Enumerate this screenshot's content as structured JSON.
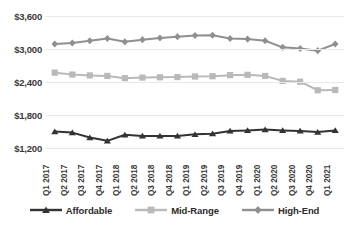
{
  "chart_data": {
    "type": "line",
    "title": "",
    "subtitle": "",
    "xlabel": "",
    "ylabel": "",
    "ylim": [
      1200,
      3600
    ],
    "yticks": [
      1200,
      1800,
      2400,
      3000,
      3600
    ],
    "ytick_labels": [
      "$1,200",
      "$1,800",
      "$2,400",
      "$3,000",
      "$3,600"
    ],
    "grid": true,
    "legend_position": "bottom",
    "categories": [
      "Q1 2017",
      "Q2 2017",
      "Q3 2017",
      "Q4 2017",
      "Q1 2018",
      "Q2 2018",
      "Q3 2018",
      "Q4 2018",
      "Q1 2019",
      "Q2 2019",
      "Q3 2019",
      "Q4 2019",
      "Q1 2020",
      "Q2 2020",
      "Q3 2020",
      "Q4 2020",
      "Q1 2021"
    ],
    "series": [
      {
        "name": "Affordable",
        "color": "#333333",
        "marker": "triangle",
        "values": [
          1500,
          1480,
          1390,
          1330,
          1440,
          1420,
          1420,
          1420,
          1450,
          1460,
          1510,
          1520,
          1535,
          1520,
          1510,
          1490,
          1520
        ]
      },
      {
        "name": "Mid-Range",
        "color": "#b9b9b9",
        "marker": "square",
        "values": [
          2570,
          2535,
          2520,
          2510,
          2470,
          2480,
          2485,
          2490,
          2500,
          2505,
          2525,
          2530,
          2510,
          2420,
          2405,
          2250,
          2255
        ]
      },
      {
        "name": "High-End",
        "color": "#8f8f8f",
        "marker": "diamond",
        "values": [
          3090,
          3110,
          3150,
          3190,
          3130,
          3170,
          3200,
          3225,
          3245,
          3250,
          3190,
          3180,
          3150,
          3030,
          3010,
          2970,
          3090
        ]
      }
    ]
  },
  "legend": {
    "items": [
      {
        "label": "Affordable",
        "color": "#333333",
        "marker": "triangle"
      },
      {
        "label": "Mid-Range",
        "color": "#b9b9b9",
        "marker": "square"
      },
      {
        "label": "High-End",
        "color": "#8f8f8f",
        "marker": "diamond"
      }
    ]
  }
}
